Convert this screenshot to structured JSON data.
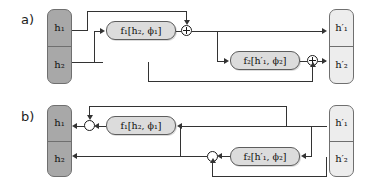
{
  "figure": {
    "type": "block-diagram",
    "panels": [
      {
        "id": "a",
        "label": "a)",
        "input_block": {
          "name": "input-vector",
          "style": "dark",
          "cells": [
            "h₁",
            "h₂"
          ]
        },
        "output_block": {
          "name": "output-vector",
          "style": "light",
          "cells": [
            "h′₁",
            "h′₂"
          ]
        },
        "functions": [
          {
            "id": "f1",
            "label": "f₁[h₂, ϕ₁]"
          },
          {
            "id": "f2",
            "label": "f₂[h′₁, ϕ₂]"
          }
        ],
        "operators": [
          {
            "id": "plus1",
            "symbol": "+",
            "kind": "add"
          },
          {
            "id": "plus2",
            "symbol": "+",
            "kind": "add"
          }
        ]
      },
      {
        "id": "b",
        "label": "b)",
        "input_block": {
          "name": "output-vector",
          "style": "dark",
          "cells": [
            "h₁",
            "h₂"
          ]
        },
        "output_block": {
          "name": "input-vector",
          "style": "light",
          "cells": [
            "h′₁",
            "h′₂"
          ]
        },
        "functions": [
          {
            "id": "f1",
            "label": "f₁[h₂, ϕ₁]"
          },
          {
            "id": "f2",
            "label": "f₂[h′₁, ϕ₂]"
          }
        ],
        "operators": [
          {
            "id": "minus1",
            "symbol": "",
            "kind": "subtract"
          },
          {
            "id": "minus2",
            "symbol": "",
            "kind": "subtract"
          }
        ]
      }
    ],
    "colors": {
      "dark_block": "#a8a8a8",
      "light_block": "#ededed",
      "function_box": "#dcdcdc",
      "wire": "#333333",
      "border": "#5d5d5d",
      "background": "#ffffff"
    }
  }
}
